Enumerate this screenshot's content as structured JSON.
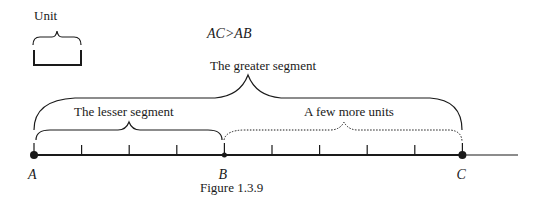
{
  "figure": {
    "caption": "Figure 1.3.9",
    "inequality": "AC>AB",
    "unit_label": "Unit",
    "greater_segment_label": "The greater segment",
    "lesser_segment_label": "The lesser segment",
    "more_units_label": "A few more units",
    "points": [
      {
        "name": "A",
        "position_units": 0
      },
      {
        "name": "B",
        "position_units": 4
      },
      {
        "name": "C",
        "position_units": 9
      }
    ],
    "tick_positions_units": [
      1,
      2,
      3,
      5,
      6,
      7,
      8
    ],
    "ink_color": "#1a1a1a"
  }
}
